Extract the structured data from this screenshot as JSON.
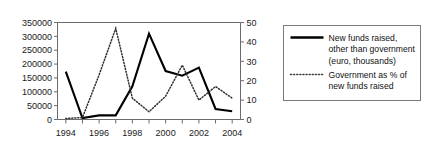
{
  "chart_data": {
    "type": "line",
    "title": "",
    "xlabel": "",
    "ylabel": "",
    "grid": false,
    "legend_position": "right",
    "x": [
      1994,
      1995,
      1996,
      1997,
      1998,
      1999,
      2000,
      2001,
      2002,
      2003,
      2004
    ],
    "x_tick_labels": [
      "1994",
      "1996",
      "1998",
      "2000",
      "2002",
      "2004"
    ],
    "x_tick_values": [
      1994,
      1996,
      1998,
      2000,
      2002,
      2004
    ],
    "xlim": [
      1993.5,
      2004.5
    ],
    "axes": {
      "left": {
        "label": "",
        "ylim": [
          0,
          350000
        ],
        "ticks": [
          0,
          50000,
          100000,
          150000,
          200000,
          250000,
          300000,
          350000
        ],
        "tick_labels": [
          "0",
          "50000",
          "100000",
          "150000",
          "200000",
          "250000",
          "300000",
          "350000"
        ]
      },
      "right": {
        "label": "",
        "ylim": [
          0,
          50
        ],
        "ticks": [
          0,
          10,
          20,
          30,
          40,
          50
        ],
        "tick_labels": [
          "0",
          "10",
          "20",
          "30",
          "40",
          "50"
        ]
      }
    },
    "series": [
      {
        "name": "New funds raised, other than government (euro, thousands)",
        "style": "solid",
        "color": "#000000",
        "axis": "left",
        "values": [
          173000,
          5000,
          15000,
          15000,
          120000,
          310000,
          175000,
          158000,
          187000,
          38000,
          30000
        ]
      },
      {
        "name": "Government as % of new funds raised",
        "style": "dotted",
        "color": "#303030",
        "axis": "right",
        "values": [
          0.5,
          1,
          23,
          47,
          11,
          4,
          12,
          28,
          10,
          17,
          11
        ]
      }
    ]
  },
  "legend": {
    "entries": [
      {
        "swatch": "solid-line-swatch",
        "lines": [
          "New funds raised,",
          "other than government",
          "(euro, thousands)"
        ]
      },
      {
        "swatch": "dotted-line-swatch",
        "lines": [
          "Government as % of",
          "new funds raised"
        ]
      }
    ]
  }
}
